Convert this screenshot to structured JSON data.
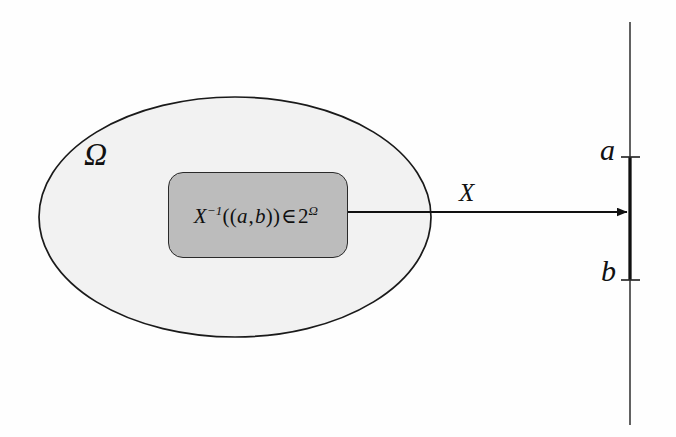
{
  "figure": {
    "caption_text": "",
    "background_color": "#fefefe",
    "title": ""
  },
  "sample_space": {
    "label": "Ω",
    "name": "omega-sample-space",
    "fill_color": "#f2f2f2",
    "stroke_color": "#1a1a1a",
    "shape": "ellipse",
    "center": {
      "x": 235,
      "y": 217
    },
    "radius": {
      "x": 196,
      "y": 120
    }
  },
  "preimage_box": {
    "formula": {
      "var": "X",
      "exponent": "−1",
      "open_parens": "((",
      "lower_bound": "a",
      "comma": ",",
      "upper_bound": "b",
      "close_parens": "))",
      "membership": "∈",
      "base": "2",
      "power": "Ω",
      "plain_text": "X⁻¹((a,b))∈2^Ω"
    },
    "fill_color": "#bcbcbc",
    "stroke_color": "#2a2a2a",
    "rect": {
      "x": 168,
      "y": 172,
      "width": 180,
      "height": 86,
      "radius": 15
    }
  },
  "mapping_arrow": {
    "label": "X",
    "name": "random-variable-map",
    "from": {
      "x": 348,
      "y": 212
    },
    "to": {
      "x": 627,
      "y": 212
    },
    "color": "#111111"
  },
  "real_line": {
    "name": "real-number-line",
    "color": "#5a5a5a",
    "highlight_color": "#111111",
    "x": 630,
    "y_top": 22,
    "y_bottom": 425,
    "ticks": [
      {
        "label": "a",
        "y": 157
      },
      {
        "label": "b",
        "y": 280
      }
    ],
    "interval": {
      "lower": "a",
      "upper": "b",
      "open": true
    }
  }
}
